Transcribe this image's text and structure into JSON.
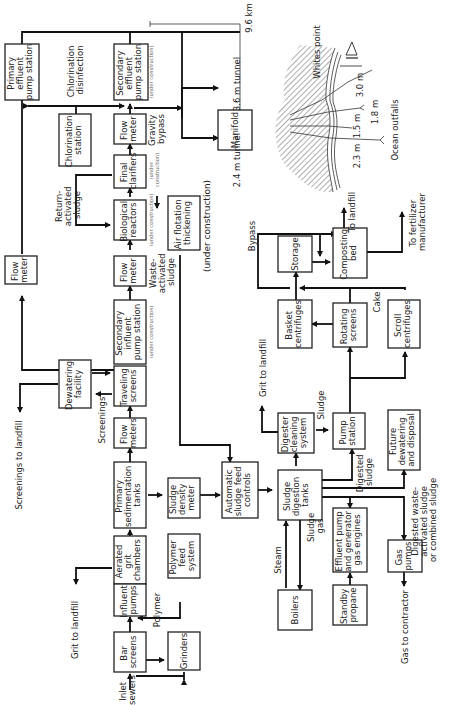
{
  "diagram": {
    "orientation": "rotated-90-ccw",
    "boxes": {
      "primary_effluent": [
        "Primary",
        "effluent",
        "pump station"
      ],
      "secondary_effluent": [
        "Secondary",
        "effluent",
        "pump station"
      ],
      "chlorination_station": [
        "Chlorination",
        "station"
      ],
      "flow_meter_top": [
        "Flow",
        "meter"
      ],
      "final_clarifiers": [
        "Final",
        "clarifiers"
      ],
      "biological_reactors": [
        "Biological",
        "reactors"
      ],
      "flow_meter_mid": [
        "Flow",
        "meter"
      ],
      "flow_meter_left": [
        "Flow",
        "meter"
      ],
      "air_flotation": [
        "Air flotation",
        "thickening"
      ],
      "secondary_influent": [
        "Secondary",
        "influent",
        "pump station"
      ],
      "dewatering": [
        "Dewatering",
        "facility"
      ],
      "traveling_screens": [
        "Traveling",
        "screens"
      ],
      "flow_meters": [
        "Flow",
        "meters"
      ],
      "primary_sedimentation": [
        "Primary",
        "sedimentation",
        "tanks"
      ],
      "sludge_density": [
        "Sludge",
        "density",
        "meter"
      ],
      "aerated_grit": [
        "Aerated",
        "grit",
        "chambers"
      ],
      "polymer_feed": [
        "Polymer",
        "feed",
        "system"
      ],
      "influent_pumps": [
        "Influent",
        "pumps"
      ],
      "bar_screens": [
        "Bar",
        "screens"
      ],
      "grinders": [
        "Grinders"
      ],
      "auto_sludge": [
        "Automatic",
        "sludge feed",
        "controls"
      ],
      "digester_cleaning": [
        "Digester",
        "cleaning",
        "system"
      ],
      "sludge_digestion": [
        "Sludge",
        "digestion",
        "tanks"
      ],
      "pump_station": [
        "Pump",
        "station"
      ],
      "future_dewatering": [
        "Future",
        "dewatering",
        "and disposal"
      ],
      "basket_centrifuges": [
        "Basket",
        "centrifuges"
      ],
      "rotating_screens": [
        "Rotating",
        "screens"
      ],
      "scroll_centrifuges": [
        "Scroll",
        "centrifuges"
      ],
      "storage": [
        "Storage"
      ],
      "composting_bed": [
        "Composting",
        "bed"
      ],
      "boilers": [
        "Boilers"
      ],
      "effluent_pump_gen": [
        "Effluent pump",
        "and generator",
        "gas engines"
      ],
      "standby_propane": [
        "Standby",
        "propane"
      ],
      "gas_pumps": [
        "Gas",
        "pumps"
      ],
      "manifold": [
        "Manifold"
      ]
    },
    "labels": {
      "chlorination_disinfection": [
        "Chlorination",
        "disinfection"
      ],
      "under_construction": "(under construction)",
      "under_construction_large": "(under construction)",
      "gravity_bypass": [
        "Gravity",
        "bypass"
      ],
      "return_activated": [
        "Return-",
        "activated",
        "sludge"
      ],
      "waste_activated": [
        "Waste-",
        "activated",
        "sludge"
      ],
      "screenings": "Screenings",
      "screenings_to_landfill": "Screenings to landfill",
      "grit_to_landfill_left": "Grit to landfill",
      "polymer": "Polymer",
      "inlet_sewers": [
        "Inlet",
        "sewers"
      ],
      "grit_to_landfill_mid": "Grit to landfill",
      "sludge": "Sludge",
      "digested_sludge": [
        "Digested",
        "sludge"
      ],
      "digested_waste": [
        "Digested waste-",
        "activated sludge",
        "or combined sludge"
      ],
      "cake": "Cake",
      "bypass": "Bypass",
      "to_landfill": "To landfill",
      "to_fertilizer": [
        "To fertilizer",
        "manufacturer"
      ],
      "steam": "Steam",
      "sludge_gas": [
        "Sludge",
        "gas"
      ],
      "gas_to_contractor": "Gas to contractor",
      "tunnel_36": "3.6 m tunnel",
      "tunnel_24": "2.4 m tunnel",
      "distance": "9.6 km",
      "whites_point": "Whites point",
      "ocean_outfalls": "Ocean outfalls",
      "outfall_30": "3.0 m",
      "outfall_18": "1.8 m",
      "outfall_15": "1.5 m",
      "outfall_23": "2.3 m"
    }
  }
}
